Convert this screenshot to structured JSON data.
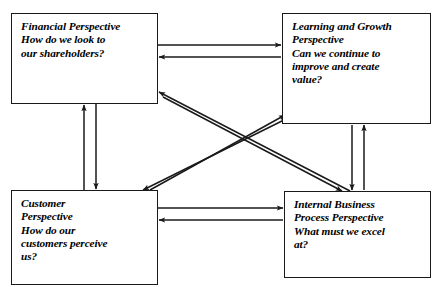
{
  "diagram": {
    "type": "balanced-scorecard",
    "line_color": "#1a1a1a",
    "background_color": "#ffffff",
    "nodes": [
      {
        "id": "financial",
        "name": "financial-perspective",
        "heading": "Financial Perspective",
        "question": "How do we look to our shareholders?",
        "text": "Financial Perspective\nHow do we look to\nour shareholders?"
      },
      {
        "id": "learning",
        "name": "learning-and-growth-perspective",
        "heading": "Learning and Growth Perspective",
        "question": "Can we continue to improve and create value?",
        "text": "Learning and Growth\nPerspective\nCan we continue to\nimprove and create\nvalue?"
      },
      {
        "id": "customer",
        "name": "customer-perspective",
        "heading": "Customer Perspective",
        "question": "How do our customers perceive us?",
        "text": "Customer\nPerspective\nHow do our\ncustomers perceive\nus?"
      },
      {
        "id": "internal",
        "name": "internal-business-process-perspective",
        "heading": "Internal Business Process Perspective",
        "question": "What must we excel at?",
        "text": "Internal Business\nProcess Perspective\nWhat must we excel\nat?"
      }
    ],
    "connections": [
      {
        "from": "financial",
        "to": "learning",
        "direction": "bidirectional",
        "style": "horizontal-top"
      },
      {
        "from": "customer",
        "to": "internal",
        "direction": "bidirectional",
        "style": "horizontal-bottom"
      },
      {
        "from": "financial",
        "to": "customer",
        "direction": "bidirectional",
        "style": "vertical-left"
      },
      {
        "from": "learning",
        "to": "internal",
        "direction": "bidirectional",
        "style": "vertical-right"
      },
      {
        "from": "financial",
        "to": "internal",
        "direction": "bidirectional",
        "style": "diagonal-down-right"
      },
      {
        "from": "customer",
        "to": "learning",
        "direction": "bidirectional",
        "style": "diagonal-up-right"
      }
    ]
  }
}
